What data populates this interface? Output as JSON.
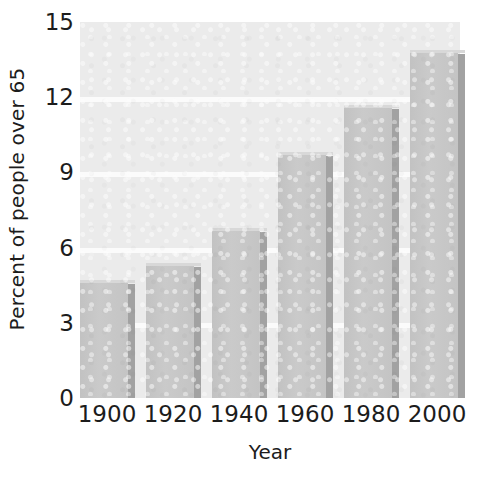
{
  "chart_data": {
    "type": "bar",
    "title": "",
    "subtitle": "",
    "xlabel": "Year",
    "ylabel": "Percent of people over 65",
    "categories": [
      "1900",
      "1920",
      "1940",
      "1960",
      "1980",
      "2000"
    ],
    "values": [
      4.7,
      5.4,
      6.8,
      9.8,
      11.7,
      13.9
    ],
    "series": [
      {
        "name": "Percent of people over 65",
        "values": [
          4.7,
          5.4,
          6.8,
          9.8,
          11.7,
          13.9
        ]
      }
    ],
    "ylim": [
      0,
      15
    ],
    "xlim_categories": [
      "1900",
      "2000"
    ],
    "ytick_labels": [
      "0",
      "3",
      "6",
      "9",
      "12",
      "15"
    ],
    "ytick_values": [
      0,
      3,
      6,
      9,
      12,
      15
    ],
    "xtick_labels": [
      "1900",
      "1920",
      "1940",
      "1960",
      "1980",
      "2000"
    ],
    "grid": true,
    "grid_axis": "y",
    "grid_color": "#fbfbfb",
    "legend": false,
    "legend_position": "none",
    "bar_color": "#c6c6c6",
    "bar_shadow_color": "#a2a2a2",
    "plot_background": "#ebebeb",
    "figure_background": "#ffffff",
    "text_color": "#1c1c1c"
  },
  "axes": {
    "y_title": "Percent of people over 65",
    "x_title": "Year",
    "yticks": [
      {
        "label": "15",
        "value": 15
      },
      {
        "label": "12",
        "value": 12
      },
      {
        "label": "9",
        "value": 9
      },
      {
        "label": "6",
        "value": 6
      },
      {
        "label": "3",
        "value": 3
      },
      {
        "label": "0",
        "value": 0
      }
    ],
    "xticks": [
      {
        "label": "1900"
      },
      {
        "label": "1920"
      },
      {
        "label": "1940"
      },
      {
        "label": "1960"
      },
      {
        "label": "1980"
      },
      {
        "label": "2000"
      }
    ]
  }
}
